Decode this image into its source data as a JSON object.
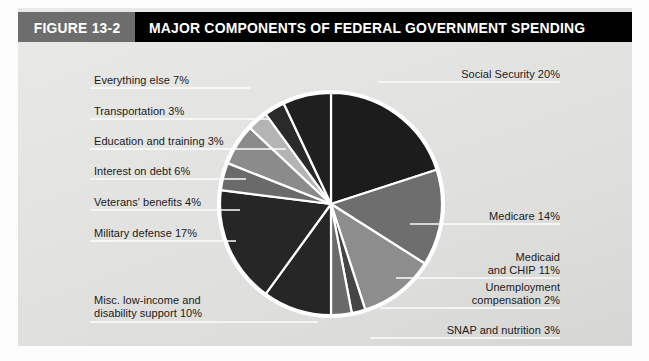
{
  "figure": {
    "number_label": "FIGURE 13-2",
    "title": "MAJOR COMPONENTS OF FEDERAL GOVERNMENT SPENDING"
  },
  "colors": {
    "banner_bg": "#000000",
    "banner_figure_bg": "#6d6d6d",
    "banner_text": "#ffffff",
    "panel_bg": "#e6e6e4",
    "label_text": "#1b1b1b",
    "leader_line": "#ffffff",
    "slice_divider": "#ffffff",
    "pie_outline": "#ffffff"
  },
  "chart_data": {
    "type": "pie",
    "title": "MAJOR COMPONENTS OF FEDERAL GOVERNMENT SPENDING",
    "subtitle": "",
    "xlabel": "",
    "ylabel": "",
    "units": "percent of federal government spending",
    "legend": "none (direct labels with leader lines)",
    "grid": false,
    "start_angle_deg": -90,
    "direction": "clockwise",
    "total": 100,
    "categories": [
      "Social Security",
      "Medicare",
      "Medicaid and CHIP",
      "Unemployment compensation",
      "SNAP and nutrition",
      "Misc. low-income and disability support",
      "Military defense",
      "Veterans' benefits",
      "Interest on debt",
      "Education and training",
      "Transportation",
      "Everything else"
    ],
    "values": [
      20,
      14,
      11,
      2,
      3,
      10,
      17,
      4,
      6,
      3,
      3,
      7
    ],
    "slices": [
      {
        "label": "Social Security 20%",
        "name": "Social Security",
        "value": 20,
        "color": "#1c1c1c"
      },
      {
        "label": "Medicare 14%",
        "name": "Medicare",
        "value": 14,
        "color": "#6e6e6e"
      },
      {
        "label": "Medicaid\nand CHIP 11%",
        "name": "Medicaid and CHIP",
        "value": 11,
        "color": "#8d8d8d"
      },
      {
        "label": "Unemployment\ncompensation 2%",
        "name": "Unemployment compensation",
        "value": 2,
        "color": "#454545"
      },
      {
        "label": "SNAP and nutrition 3%",
        "name": "SNAP and nutrition",
        "value": 3,
        "color": "#6a6a6a"
      },
      {
        "label": "Misc. low-income and\ndisability support 10%",
        "name": "Misc. low-income and disability support",
        "value": 10,
        "color": "#262626"
      },
      {
        "label": "Military defense 17%",
        "name": "Military defense",
        "value": 17,
        "color": "#262626"
      },
      {
        "label": "Veterans' benefits 4%",
        "name": "Veterans' benefits",
        "value": 4,
        "color": "#6a6a6a"
      },
      {
        "label": "Interest on debt 6%",
        "name": "Interest on debt",
        "value": 6,
        "color": "#8b8b8b"
      },
      {
        "label": "Education and training 3%",
        "name": "Education and training",
        "value": 3,
        "color": "#b4b4b4"
      },
      {
        "label": "Transportation 3%",
        "name": "Transportation",
        "value": 3,
        "color": "#2a2a2a"
      },
      {
        "label": "Everything else 7%",
        "name": "Everything else",
        "value": 7,
        "color": "#1f1f1f"
      }
    ]
  },
  "labels": {
    "social_security": "Social Security 20%",
    "medicare": "Medicare 14%",
    "medicaid_line1": "Medicaid",
    "medicaid_line2": "and CHIP 11%",
    "unemployment_line1": "Unemployment",
    "unemployment_line2": "compensation 2%",
    "snap": "SNAP and nutrition 3%",
    "misc_line1": "Misc. low-income and",
    "misc_line2": "disability support 10%",
    "military": "Military defense 17%",
    "veterans": "Veterans' benefits 4%",
    "interest": "Interest on debt 6%",
    "education": "Education and training 3%",
    "transportation": "Transportation 3%",
    "everything_else": "Everything else 7%"
  }
}
